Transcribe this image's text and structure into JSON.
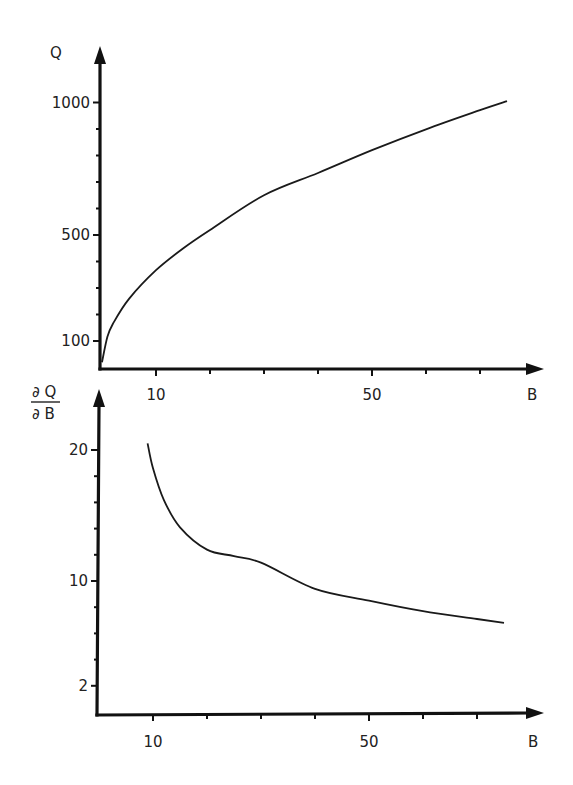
{
  "chart_data": [
    {
      "type": "line",
      "title": "",
      "xlabel": "B",
      "ylabel": "Q",
      "xlim": [
        0,
        80
      ],
      "ylim": [
        0,
        1100
      ],
      "grid": false,
      "legend": null,
      "x_ticks": [
        10,
        20,
        30,
        40,
        50,
        60,
        70
      ],
      "x_tick_labels": [
        {
          "value": 10,
          "label": "10"
        },
        {
          "value": 50,
          "label": "50"
        }
      ],
      "y_ticks": [
        100,
        200,
        300,
        400,
        500,
        600,
        700,
        800,
        900,
        1000
      ],
      "y_tick_labels": [
        {
          "value": 100,
          "label": "100"
        },
        {
          "value": 500,
          "label": "500"
        },
        {
          "value": 1000,
          "label": "1000"
        }
      ],
      "series": [
        {
          "name": "Q(B)",
          "x": [
            0,
            1,
            2,
            5,
            10,
            15,
            20,
            30,
            40,
            50,
            60,
            70,
            75
          ],
          "y": [
            20,
            116,
            164,
            259,
            367,
            449,
            519,
            650,
            734,
            820,
            899,
            971,
            1005
          ]
        }
      ]
    },
    {
      "type": "line",
      "title": "",
      "xlabel": "B",
      "ylabel": "∂Q/∂B",
      "xlim": [
        0,
        80
      ],
      "ylim": [
        0,
        23
      ],
      "grid": false,
      "legend": null,
      "x_ticks": [
        10,
        20,
        30,
        40,
        50,
        60,
        70
      ],
      "x_tick_labels": [
        {
          "value": 10,
          "label": "10"
        },
        {
          "value": 50,
          "label": "50"
        }
      ],
      "y_ticks": [
        2,
        4,
        6,
        8,
        10,
        12,
        14,
        16,
        18,
        20
      ],
      "y_tick_labels": [
        {
          "value": 2,
          "label": "2"
        },
        {
          "value": 10,
          "label": "10"
        },
        {
          "value": 20,
          "label": "20"
        }
      ],
      "series": [
        {
          "name": "dQ/dB",
          "x": [
            9,
            10,
            12,
            15,
            20,
            25,
            30,
            40,
            50,
            60,
            70,
            75
          ],
          "y": [
            20.5,
            18.6,
            16.2,
            14.1,
            12.4,
            11.9,
            11.4,
            9.4,
            8.5,
            7.7,
            7.1,
            6.8
          ]
        }
      ]
    }
  ],
  "labels": {
    "top_y_axis": "Q",
    "top_x_axis": "B",
    "bottom_y_axis_num": "∂ Q",
    "bottom_y_axis_den": "∂ B",
    "bottom_x_axis": "B"
  },
  "colors": {
    "ink": "#111111",
    "background": "#ffffff"
  }
}
